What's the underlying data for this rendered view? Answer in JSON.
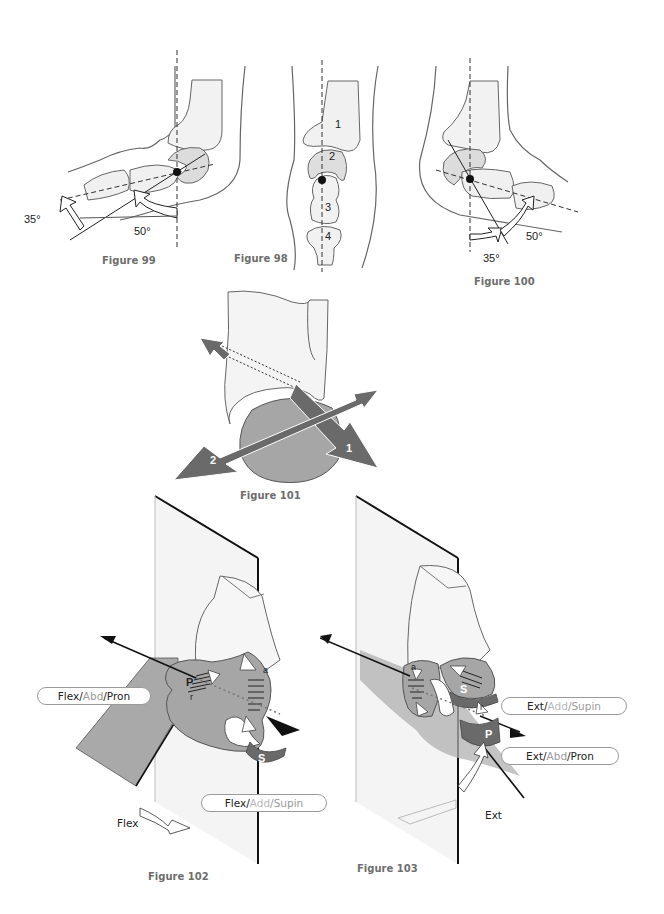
{
  "page": {
    "figures": [
      {
        "id": "fig99",
        "caption": "Figure 99",
        "angles": [
          "35°",
          "50°"
        ]
      },
      {
        "id": "fig98",
        "caption": "Figure 98",
        "bone_labels": [
          "1",
          "2",
          "3",
          "4"
        ]
      },
      {
        "id": "fig100",
        "caption": "Figure 100",
        "angles": [
          "50°",
          "35°"
        ]
      },
      {
        "id": "fig101",
        "caption": "Figure 101",
        "axis_labels": [
          "1",
          "2"
        ]
      },
      {
        "id": "fig102",
        "caption": "Figure 102",
        "motion_label": "Flex",
        "glyphs": [
          "P",
          "r",
          "a",
          "S"
        ],
        "pills": [
          {
            "parts": [
              "Flex/",
              "Abd",
              "/Pron"
            ]
          },
          {
            "parts": [
              "Flex/",
              "Add",
              "/Supin"
            ]
          }
        ]
      },
      {
        "id": "fig103",
        "caption": "Figure 103",
        "motion_label": "Ext",
        "glyphs": [
          "a",
          "S",
          "r",
          "P"
        ],
        "pills": [
          {
            "parts": [
              "Ext/ ",
              "Add",
              "/Supin"
            ]
          },
          {
            "parts": [
              "Ext/ ",
              "Abd",
              "/Pron"
            ]
          }
        ]
      }
    ],
    "colors": {
      "line": "#555555",
      "bone_fill": "#f0f0f0",
      "cartilage_fill": "#dcdcdc",
      "surface_grey": "#a8a8a8",
      "axis_dark": "#6a6a6a",
      "plane_fill": "#f4f4f4",
      "caption": "#6e6e6e"
    }
  }
}
